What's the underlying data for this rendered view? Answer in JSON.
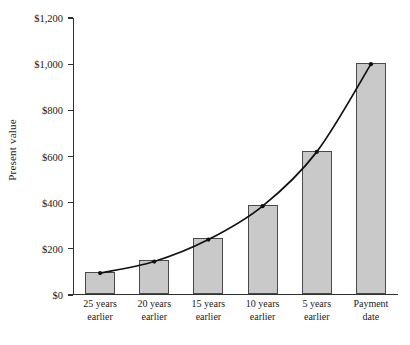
{
  "chart_data": {
    "type": "bar",
    "title": "",
    "subtitle": "",
    "xlabel": "",
    "ylabel": "Present value",
    "categories": [
      "25 years earlier",
      "20 years earlier",
      "15 years earlier",
      "10 years earlier",
      "5 years earlier",
      "Payment date"
    ],
    "category_lines": [
      [
        "25 years",
        "earlier"
      ],
      [
        "20 years",
        "earlier"
      ],
      [
        "15 years",
        "earlier"
      ],
      [
        "10 years",
        "earlier"
      ],
      [
        "5 years",
        "earlier"
      ],
      [
        "Payment",
        "date"
      ]
    ],
    "values": [
      95,
      145,
      240,
      385,
      620,
      1000
    ],
    "ylim": [
      0,
      1200
    ],
    "ytick_values": [
      0,
      200,
      400,
      600,
      800,
      1000,
      1200
    ],
    "ytick_labels": [
      "$0",
      "$200",
      "$400",
      "$600",
      "$800",
      "$1,000",
      "$1,200"
    ],
    "grid": false,
    "legend": "none",
    "series": [
      {
        "name": "Present value",
        "values": [
          95,
          145,
          240,
          385,
          620,
          1000
        ]
      },
      {
        "name": "Present value curve",
        "type": "line",
        "values": [
          95,
          145,
          240,
          385,
          620,
          1000
        ],
        "markers": true
      }
    ],
    "colors": {
      "bar_fill": "#c9c9c9",
      "bar_stroke": "#4a4a4a",
      "curve": "#111111",
      "axis": "#303030",
      "text": "#1a1a1a"
    }
  },
  "figure": {
    "top_partial_text": ""
  }
}
